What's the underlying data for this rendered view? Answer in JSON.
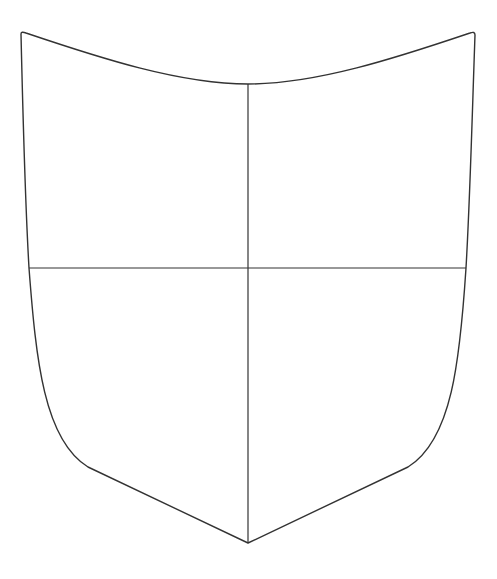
{
  "figure": {
    "width": 497,
    "height": 579,
    "background": "#ffffff",
    "stroke_color": "#333333",
    "outline_stroke_width": 1.4,
    "divider_stroke_width": 1.2
  },
  "shield": {
    "outline_path": "M 21 34 Q 21 31 26 33 C 100 58 180 84 248 84 C 316 84 396 58 470 33 Q 475 31 475 35 C 472 120 470 200 466 268 C 460 360 452 440 408 467 L 248 543 L 88 467 C 44 440 36 360 29 268 C 25 200 23 120 21 34 Z",
    "fill": "#ffffff"
  },
  "dividers": {
    "vertical": {
      "x1": 248,
      "y1": 84,
      "x2": 248,
      "y2": 543
    },
    "horizontal": {
      "x1": 29,
      "y1": 268,
      "x2": 466,
      "y2": 268
    }
  },
  "quarters": [
    {
      "name": "dexter-chief",
      "label": ""
    },
    {
      "name": "sinister-chief",
      "label": ""
    },
    {
      "name": "dexter-base",
      "label": ""
    },
    {
      "name": "sinister-base",
      "label": ""
    }
  ]
}
